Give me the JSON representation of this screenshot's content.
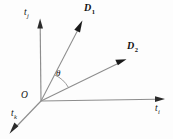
{
  "figure": {
    "type": "vector-diagram",
    "background_color": "#fdfdfd",
    "line_color": "#8d8d8d",
    "arrow_color": "#1a1a1a",
    "text_color": "#111111",
    "width": 173,
    "height": 139
  },
  "origin": {
    "label": "O",
    "x": 41,
    "y": 101
  },
  "axes": [
    {
      "name": "axis-tj",
      "label_base": "t",
      "label_sub": "j",
      "direction": "up",
      "start": [
        41,
        101
      ],
      "end": [
        40,
        22
      ],
      "label_x": 25,
      "label_y": 11
    },
    {
      "name": "axis-ti",
      "label_base": "t",
      "label_sub": "i",
      "direction": "right",
      "start": [
        41,
        101
      ],
      "end": [
        163,
        99
      ],
      "label_x": 154,
      "label_y": 107
    },
    {
      "name": "axis-tk",
      "label_base": "t",
      "label_sub": "k",
      "direction": "lower-left",
      "start": [
        41,
        101
      ],
      "end": [
        11,
        133
      ],
      "label_x": 11,
      "label_y": 112
    }
  ],
  "vectors": [
    {
      "name": "vector-d1",
      "label_base": "D",
      "label_sub": "1",
      "start": [
        41,
        101
      ],
      "end": [
        82,
        22
      ],
      "label_x": 85,
      "label_y": 6
    },
    {
      "name": "vector-d2",
      "label_base": "D",
      "label_sub": "2",
      "start": [
        41,
        101
      ],
      "end": [
        125,
        60
      ],
      "label_x": 128,
      "label_y": 45
    }
  ],
  "angle": {
    "name": "angle-theta",
    "symbol": "θ",
    "label_x": 57,
    "label_y": 73,
    "between": [
      "vector-d1",
      "vector-d2"
    ],
    "arc_radius": 30
  }
}
